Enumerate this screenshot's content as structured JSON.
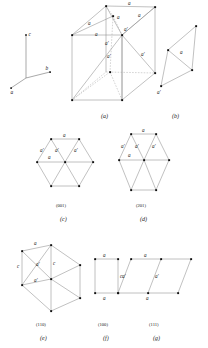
{
  "figure": {
    "type": "crystallography-lattice-plate",
    "background": "#ffffff",
    "line_color": "#8e8e8e",
    "node_color": "#101010"
  },
  "axes": {
    "c": "c",
    "b": "b",
    "a": "a"
  },
  "panels": [
    {
      "id": "a",
      "caption": "(a)",
      "miller": "",
      "labels": [
        "a",
        "a",
        "a",
        "a",
        "a",
        "a'",
        "a'",
        "a'",
        "a'",
        "a'"
      ]
    },
    {
      "id": "b",
      "caption": "(b)",
      "miller": "",
      "labels": [
        "a",
        "a'"
      ]
    },
    {
      "id": "c",
      "caption": "(c)",
      "miller": "(001)",
      "labels": [
        "a",
        "a",
        "a'",
        "a'",
        "a'"
      ]
    },
    {
      "id": "d",
      "caption": "(d)",
      "miller": "(201)",
      "labels": [
        "a",
        "a",
        "a'",
        "a'",
        "a'"
      ]
    },
    {
      "id": "e",
      "caption": "(e)",
      "miller": "(110)",
      "labels": [
        "a",
        "c",
        "c",
        "a'",
        "a'"
      ]
    },
    {
      "id": "f",
      "caption": "(f)",
      "miller": "(100)",
      "labels": [
        "a",
        "a",
        "c"
      ]
    },
    {
      "id": "g",
      "caption": "(g)",
      "miller": "(111)",
      "labels": [
        "a",
        "a",
        "a'",
        "a'"
      ]
    }
  ]
}
